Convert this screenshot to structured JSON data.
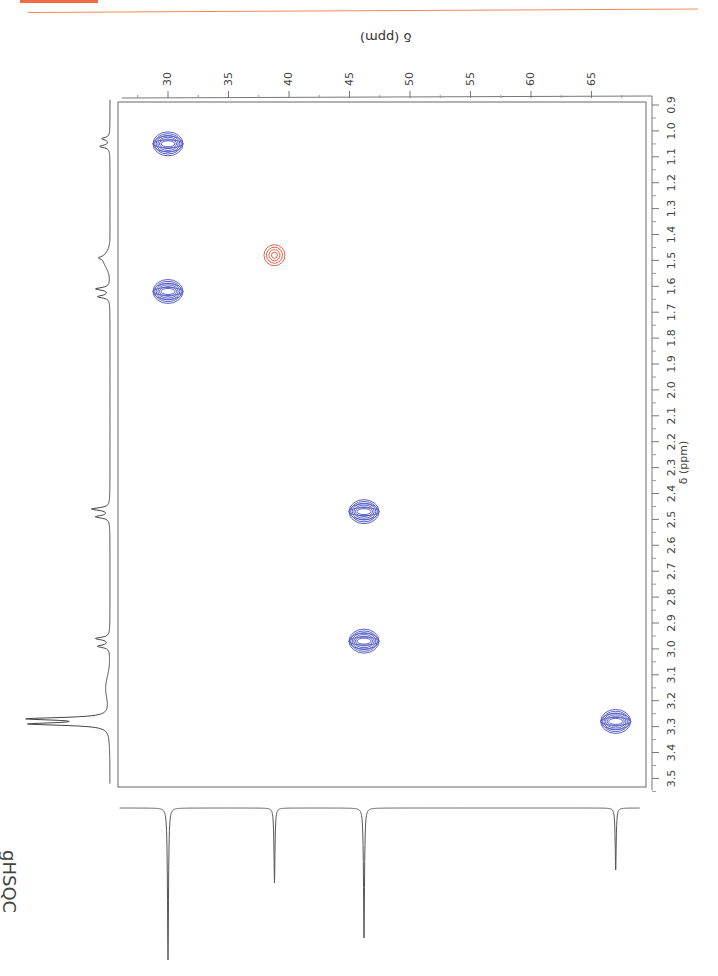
{
  "header": {
    "accent_color": "#f26b43"
  },
  "experiment_label": "gHSQC",
  "chart_data": {
    "type": "scatter",
    "title": "gHSQC",
    "subtype": "2D NMR contour (HSQC)",
    "xlabel": "δ (ppm)",
    "x_axis_nucleus": "1H",
    "ylabel": "δ (ppm)",
    "y_axis_nucleus": "13C",
    "x_ticks": [
      "0.9",
      "1.0",
      "1.1",
      "1.2",
      "1.3",
      "1.4",
      "1.5",
      "1.6",
      "1.7",
      "1.8",
      "1.9",
      "2.0",
      "2.1",
      "2.2",
      "2.3",
      "2.4",
      "2.5",
      "2.6",
      "2.7",
      "2.8",
      "2.9",
      "3.0",
      "3.1",
      "3.2",
      "3.3",
      "3.4",
      "3.5"
    ],
    "y_ticks": [
      "30",
      "35",
      "40",
      "45",
      "50",
      "55",
      "60",
      "65"
    ],
    "xlim": [
      0.9,
      3.5
    ],
    "ylim": [
      26,
      69
    ],
    "grid": false,
    "series": [
      {
        "name": "CH/CH3 (positive)",
        "color": "#5b63c9",
        "points": [
          {
            "h": 1.05,
            "c": 30.0
          },
          {
            "h": 1.62,
            "c": 30.0
          },
          {
            "h": 2.47,
            "c": 46.2
          },
          {
            "h": 2.97,
            "c": 46.2
          },
          {
            "h": 3.28,
            "c": 67.0
          }
        ]
      },
      {
        "name": "CH2 (negative)",
        "color": "#e0604a",
        "points": [
          {
            "h": 1.48,
            "c": 38.8
          }
        ]
      }
    ],
    "projection_1h_peaks_ppm": [
      1.03,
      1.06,
      1.49,
      1.61,
      1.64,
      2.46,
      2.49,
      2.96,
      2.99,
      3.27,
      3.29
    ],
    "projection_13c_peaks_ppm": [
      30.0,
      38.8,
      46.2,
      67.0
    ]
  },
  "axes": {
    "c13_title": "δ (ppm)",
    "h1_title": "δ (ppm)"
  }
}
